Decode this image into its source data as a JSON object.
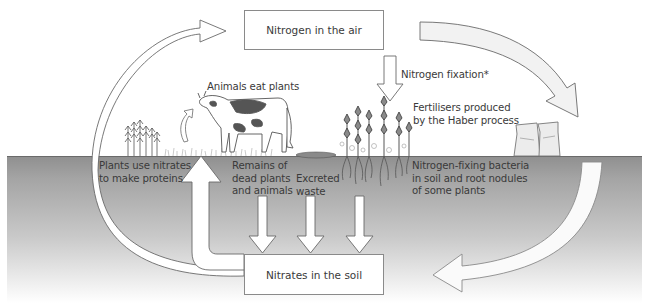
{
  "diagram": {
    "title_fragment": "",
    "nodes": {
      "air": {
        "label": "Nitrogen in the air"
      },
      "soil": {
        "label": "Nitrates in the soil"
      }
    },
    "labels": {
      "animals_eat_plants": "Animals eat plants",
      "nitrogen_fixation": "Nitrogen fixation*",
      "fertilisers": "Fertilisers produced\nby the Haber process",
      "plants_use_nitrates": "Plants use nitrates\nto make proteins",
      "remains": "Remains of\ndead plants\nand animals",
      "excreted": "Excreted\nwaste",
      "nitrogen_fixing_bacteria": "Nitrogen-fixing bacteria\nin soil and root nodules\nof some plants"
    },
    "arrows": [
      {
        "from": "Nitrates in the soil",
        "to": "Nitrogen in the air",
        "route": "left arc"
      },
      {
        "from": "Nitrogen in the air",
        "to": "Fertilisers",
        "route": "right arc"
      },
      {
        "from": "Fertilisers",
        "to": "Nitrates in the soil",
        "route": "lower right arc"
      },
      {
        "from": "Nitrogen in the air",
        "to": "Nitrogen-fixing plants",
        "label": "Nitrogen fixation*"
      },
      {
        "from": "Nitrates in the soil",
        "to": "Plants",
        "label": "Plants use nitrates to make proteins"
      },
      {
        "from": "Remains of dead plants and animals",
        "to": "Nitrates in the soil"
      },
      {
        "from": "Excreted waste",
        "to": "Nitrates in the soil"
      },
      {
        "from": "Nitrogen-fixing bacteria",
        "to": "Nitrates in the soil"
      },
      {
        "from": "Plants",
        "to": "Animals",
        "label": "Animals eat plants"
      }
    ],
    "illustrations": [
      "cereal-plants",
      "cow",
      "grass",
      "excreted-waste",
      "legume-plants",
      "fertiliser-sacks",
      "soil"
    ]
  }
}
